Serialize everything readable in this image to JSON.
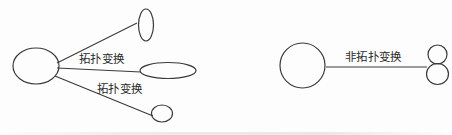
{
  "figure": {
    "title": "",
    "stroke_color": "#3a3a3a",
    "text_color": "#2b2b2b",
    "background_color": "#fdfdfd",
    "labels": {
      "topological_1": "拓扑变换",
      "topological_2": "拓扑变换",
      "non_topological": "非拓扑变换"
    },
    "left_group": {
      "source_shape": "circle",
      "target_shapes": [
        "vertical-ellipse",
        "horizontal-ellipse",
        "small-circle"
      ],
      "connector_count": 3
    },
    "right_group": {
      "source_shape": "circle",
      "target_shape": "figure-eight",
      "connector_count": 1
    }
  }
}
